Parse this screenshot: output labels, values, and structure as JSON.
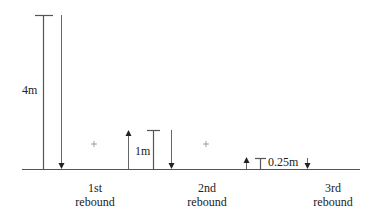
{
  "diagram": {
    "drops": [
      {
        "height_label": "4m",
        "height_m": 4
      },
      {
        "height_label": "1m",
        "height_m": 1
      },
      {
        "height_label": "0.25m",
        "height_m": 0.25
      }
    ],
    "rebounds": [
      {
        "line1": "1st",
        "line2": "rebound"
      },
      {
        "line1": "2nd",
        "line2": "rebound"
      },
      {
        "line1": "3rd",
        "line2": "rebound"
      }
    ],
    "plus_marks": [
      "+",
      "+"
    ]
  }
}
